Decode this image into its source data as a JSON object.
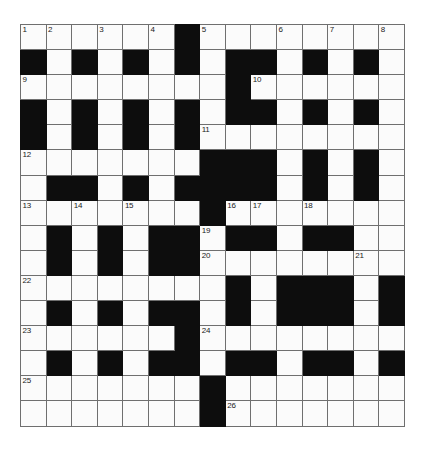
{
  "puzzle": {
    "title": "Crossword Grid",
    "type": "crossword-grid",
    "columns": 15,
    "rows": 16,
    "cell_size_px": 25.6,
    "colors": {
      "background": "#ffffff",
      "cell_fill": "#fbfbfb",
      "block_fill": "#0d0d0d",
      "grid_line": "#6f6f6f",
      "number_text": "#1a1a1a"
    },
    "highest_clue_number": 26,
    "legend": {
      "0": "white (fillable) cell",
      "1": "black (blocked) cell"
    },
    "grid": [
      [
        0,
        0,
        0,
        0,
        0,
        0,
        1,
        0,
        0,
        0,
        0,
        0,
        0,
        0,
        0
      ],
      [
        1,
        0,
        1,
        0,
        1,
        0,
        1,
        0,
        1,
        1,
        0,
        1,
        0,
        1,
        0
      ],
      [
        0,
        0,
        0,
        0,
        0,
        0,
        0,
        0,
        1,
        0,
        0,
        0,
        0,
        0,
        0
      ],
      [
        1,
        0,
        1,
        0,
        1,
        0,
        1,
        0,
        1,
        1,
        0,
        1,
        0,
        1,
        0
      ],
      [
        1,
        0,
        1,
        0,
        1,
        0,
        1,
        0,
        0,
        0,
        0,
        0,
        0,
        0,
        0
      ],
      [
        0,
        0,
        0,
        0,
        0,
        0,
        0,
        1,
        1,
        1,
        0,
        1,
        0,
        1,
        0
      ],
      [
        0,
        1,
        1,
        0,
        1,
        0,
        1,
        1,
        1,
        1,
        0,
        1,
        0,
        1,
        0
      ],
      [
        0,
        0,
        0,
        0,
        0,
        0,
        0,
        1,
        0,
        0,
        0,
        0,
        0,
        0,
        0
      ],
      [
        0,
        1,
        0,
        1,
        0,
        1,
        1,
        0,
        1,
        1,
        0,
        1,
        1,
        0,
        0
      ],
      [
        0,
        1,
        0,
        1,
        0,
        1,
        1,
        0,
        0,
        0,
        0,
        0,
        0,
        0,
        0
      ],
      [
        0,
        0,
        0,
        0,
        0,
        0,
        0,
        0,
        1,
        0,
        1,
        1,
        1,
        0,
        1
      ],
      [
        0,
        1,
        0,
        1,
        0,
        1,
        1,
        0,
        1,
        0,
        1,
        1,
        1,
        0,
        1
      ],
      [
        0,
        0,
        0,
        0,
        0,
        0,
        1,
        0,
        0,
        0,
        0,
        0,
        0,
        0,
        0
      ],
      [
        0,
        1,
        0,
        1,
        0,
        1,
        1,
        0,
        1,
        1,
        0,
        1,
        1,
        0,
        1
      ],
      [
        0,
        0,
        0,
        0,
        0,
        0,
        0,
        1,
        0,
        0,
        0,
        0,
        0,
        0,
        0
      ],
      [
        0,
        0,
        0,
        0,
        0,
        0,
        0,
        1,
        0,
        0,
        0,
        0,
        0,
        0,
        0
      ]
    ],
    "numbers": [
      {
        "n": "1",
        "row": 0,
        "col": 0
      },
      {
        "n": "2",
        "row": 0,
        "col": 1
      },
      {
        "n": "3",
        "row": 0,
        "col": 3
      },
      {
        "n": "4",
        "row": 0,
        "col": 5
      },
      {
        "n": "5",
        "row": 0,
        "col": 7
      },
      {
        "n": "6",
        "row": 0,
        "col": 10
      },
      {
        "n": "7",
        "row": 0,
        "col": 12
      },
      {
        "n": "8",
        "row": 0,
        "col": 14
      },
      {
        "n": "9",
        "row": 2,
        "col": 0
      },
      {
        "n": "10",
        "row": 2,
        "col": 9
      },
      {
        "n": "11",
        "row": 4,
        "col": 7
      },
      {
        "n": "12",
        "row": 5,
        "col": 0
      },
      {
        "n": "13",
        "row": 7,
        "col": 0
      },
      {
        "n": "14",
        "row": 7,
        "col": 2
      },
      {
        "n": "15",
        "row": 7,
        "col": 4
      },
      {
        "n": "16",
        "row": 7,
        "col": 8
      },
      {
        "n": "17",
        "row": 7,
        "col": 9
      },
      {
        "n": "18",
        "row": 7,
        "col": 11
      },
      {
        "n": "19",
        "row": 8,
        "col": 7
      },
      {
        "n": "20",
        "row": 9,
        "col": 7
      },
      {
        "n": "21",
        "row": 9,
        "col": 13
      },
      {
        "n": "22",
        "row": 10,
        "col": 0
      },
      {
        "n": "23",
        "row": 12,
        "col": 0
      },
      {
        "n": "24",
        "row": 12,
        "col": 7
      },
      {
        "n": "25",
        "row": 14,
        "col": 0
      },
      {
        "n": "26",
        "row": 15,
        "col": 8
      }
    ]
  }
}
